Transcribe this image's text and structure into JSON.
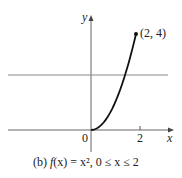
{
  "chart_data": {
    "type": "line",
    "title": "",
    "caption": "(b) f(x) = x², 0 ≤ x ≤ 2",
    "xlabel": "x",
    "ylabel": "y",
    "x": [
      0,
      0.25,
      0.5,
      0.75,
      1,
      1.25,
      1.5,
      1.75,
      2
    ],
    "series": [
      {
        "name": "f(x) = x^2",
        "values": [
          0,
          0.0625,
          0.25,
          0.5625,
          1,
          1.5625,
          2.25,
          3.0625,
          4
        ]
      }
    ],
    "annotations": [
      {
        "label": "(2, 4)",
        "x": 2,
        "y": 4
      }
    ],
    "horizontal_line": {
      "y": 2.5
    },
    "x_ticks": [
      "0",
      "2"
    ],
    "xlim": [
      -3.3,
      3.5
    ],
    "ylim": [
      -0.6,
      4.6
    ],
    "grid": false
  },
  "labels": {
    "y_axis": "y",
    "x_axis": "x",
    "origin": "0",
    "tick_2": "2",
    "point": "(2, 4)",
    "caption_prefix": "(b) ",
    "caption_f": "f",
    "caption_rest": "(x) = x², 0 ≤ x ≤ 2"
  }
}
